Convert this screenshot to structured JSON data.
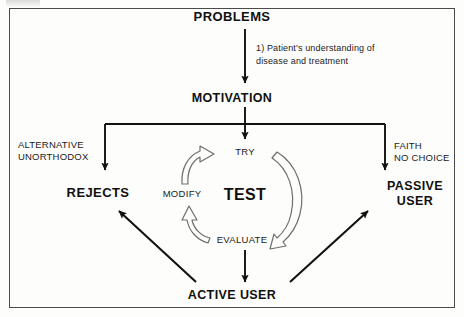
{
  "diagram": {
    "title_node": "PROBLEMS",
    "motivation_node": "MOTIVATION",
    "annotation": "1)  Patient's understanding  of\n     disease and treatment",
    "left_branch_label": "ALTERNATIVE\nUNORTHODOX",
    "right_branch_label": "FAITH\nNO CHOICE",
    "rejects_node": "REJECTS",
    "passive_user_node": "PASSIVE\nUSER",
    "active_user_node": "ACTIVE USER",
    "cycle": {
      "center_label": "TEST",
      "try_label": "TRY",
      "modify_label": "MODIFY",
      "evaluate_label": "EVALUATE"
    },
    "colors": {
      "ink": "#101010",
      "line": "#111111",
      "hollow_arrow_stroke": "#6e6e6e",
      "frame": "#4a4a48",
      "paper": "#fdfdfc"
    }
  }
}
